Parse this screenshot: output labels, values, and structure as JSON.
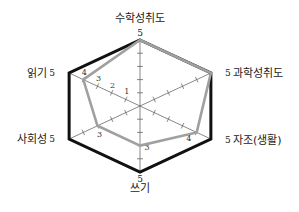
{
  "chart_data": {
    "type": "radar",
    "title": "",
    "axes": [
      "수학성취도",
      "과학성취도",
      "자조(생활)",
      "쓰기",
      "사회성",
      "읽기"
    ],
    "range": [
      0,
      5
    ],
    "ticks": [
      1,
      2,
      3,
      4,
      5
    ],
    "series": [
      {
        "name": "outer",
        "color": "#111111",
        "values": [
          5,
          5,
          5,
          5,
          5,
          5
        ]
      },
      {
        "name": "inner",
        "color": "#a0a0a0",
        "values": [
          5,
          5,
          4,
          3,
          3,
          4
        ]
      }
    ],
    "axis_tick_labels_shown": {
      "axis": "읽기",
      "labels": [
        "1",
        "2",
        "3",
        "4"
      ]
    },
    "point_labels": [
      {
        "axis": "수학성취도",
        "text": "5"
      },
      {
        "axis": "과학성취도",
        "text": "5"
      },
      {
        "axis": "자조(생활)",
        "text": "5"
      },
      {
        "axis": "쓰기",
        "text": "5"
      },
      {
        "axis": "사회성",
        "text": "5"
      },
      {
        "axis": "읽기",
        "text": "5"
      }
    ],
    "inner_point_labels": [
      {
        "axis": "자조(생활)",
        "text": "4"
      },
      {
        "axis": "쓰기",
        "text": "3"
      },
      {
        "axis": "사회성",
        "text": "3"
      }
    ],
    "grid": false,
    "legend": "none"
  }
}
